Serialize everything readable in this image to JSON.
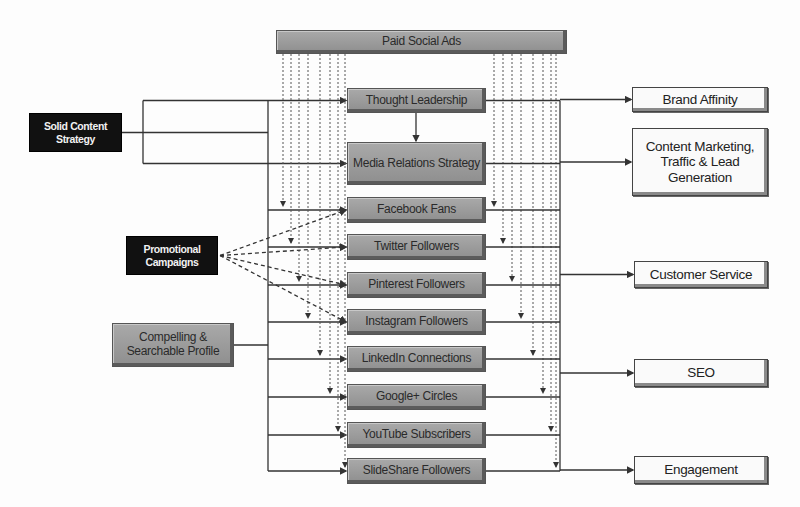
{
  "diagram": {
    "top": {
      "id": "paid",
      "label": "Paid Social Ads",
      "x": 276,
      "y": 30,
      "w": 291,
      "h": 24
    },
    "inputs": [
      {
        "id": "solid",
        "label": "Solid Content Strategy",
        "style": "black",
        "x": 29,
        "y": 113,
        "w": 93,
        "h": 39
      },
      {
        "id": "promo",
        "label": "Promotional Campaigns",
        "style": "black",
        "x": 126,
        "y": 236,
        "w": 92,
        "h": 39
      },
      {
        "id": "profile",
        "label": "Compelling & Searchable Profile",
        "style": "gray",
        "x": 112,
        "y": 323,
        "w": 122,
        "h": 44
      }
    ],
    "channels": [
      {
        "id": "thought",
        "label": "Thought Leadership",
        "x": 347,
        "y": 88,
        "w": 139,
        "h": 25
      },
      {
        "id": "media",
        "label": "Media Relations Strategy",
        "x": 347,
        "y": 142,
        "w": 139,
        "h": 43
      },
      {
        "id": "facebook",
        "label": "Facebook Fans",
        "x": 347,
        "y": 197,
        "w": 139,
        "h": 26
      },
      {
        "id": "twitter",
        "label": "Twitter Followers",
        "x": 347,
        "y": 234,
        "w": 139,
        "h": 26
      },
      {
        "id": "pinterest",
        "label": "Pinterest Followers",
        "x": 347,
        "y": 272,
        "w": 139,
        "h": 26
      },
      {
        "id": "instagram",
        "label": "Instagram Followers",
        "x": 347,
        "y": 309,
        "w": 139,
        "h": 26
      },
      {
        "id": "linkedin",
        "label": "LinkedIn Connections",
        "x": 347,
        "y": 346,
        "w": 139,
        "h": 26
      },
      {
        "id": "google",
        "label": "Google+ Circles",
        "x": 347,
        "y": 384,
        "w": 139,
        "h": 26
      },
      {
        "id": "youtube",
        "label": "YouTube Subscribers",
        "x": 347,
        "y": 422,
        "w": 139,
        "h": 26
      },
      {
        "id": "slideshare",
        "label": "SlideShare Followers",
        "x": 347,
        "y": 458,
        "w": 139,
        "h": 26
      }
    ],
    "outcomes": [
      {
        "id": "brand",
        "label": "Brand Affinity",
        "x": 632,
        "y": 87,
        "w": 136,
        "h": 25
      },
      {
        "id": "content",
        "label": "Content Marketing, Traffic & Lead Generation",
        "x": 632,
        "y": 128,
        "w": 136,
        "h": 68
      },
      {
        "id": "service",
        "label": "Customer Service",
        "x": 634,
        "y": 261,
        "w": 134,
        "h": 27
      },
      {
        "id": "seo",
        "label": "SEO",
        "x": 634,
        "y": 359,
        "w": 134,
        "h": 28
      },
      {
        "id": "engage",
        "label": "Engagement",
        "x": 634,
        "y": 456,
        "w": 134,
        "h": 28
      }
    ],
    "colors": {
      "line": "#333333",
      "dotted": "#555555",
      "gray_box": "#9a9a9a",
      "black_box": "#111111",
      "outcome_box": "#fafafa"
    }
  }
}
